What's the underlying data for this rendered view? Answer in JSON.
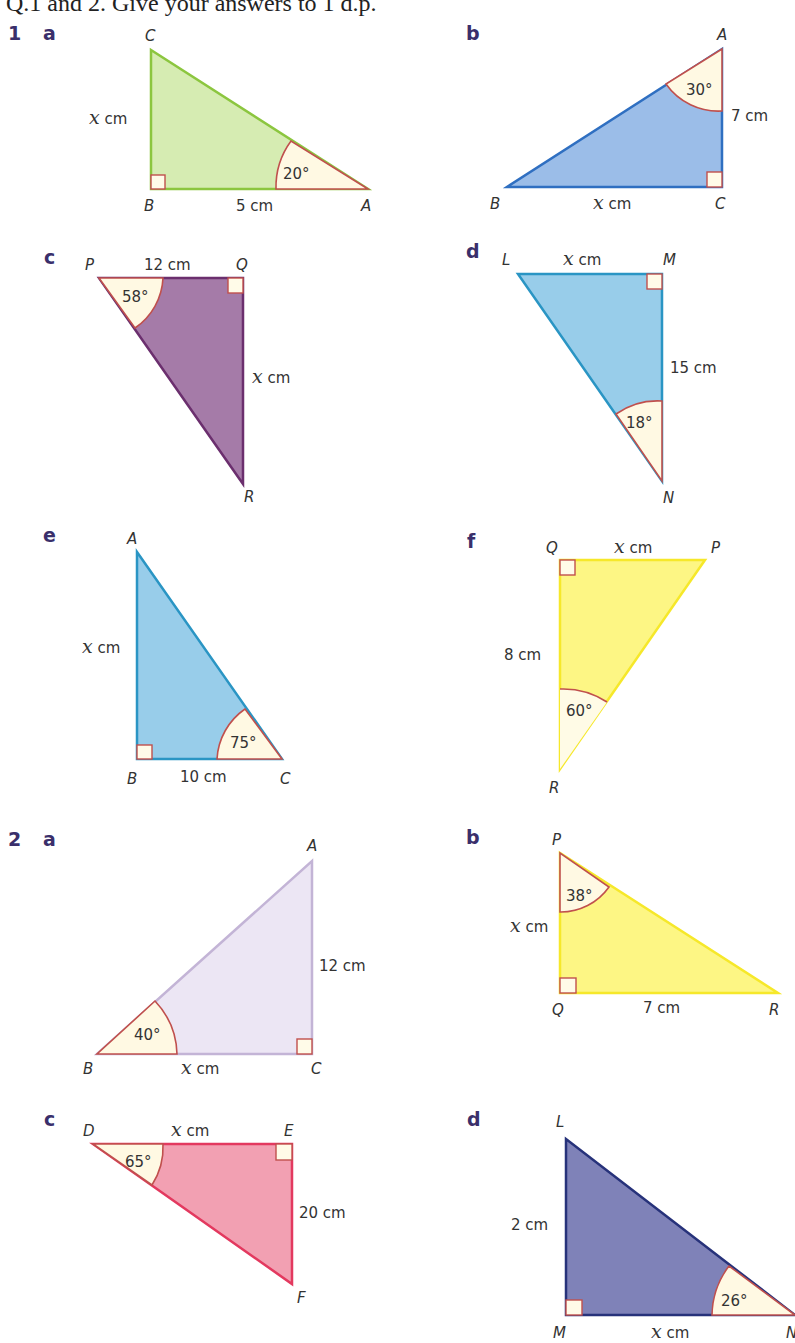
{
  "intro_text": "Q.1 and 2. Give your answers to 1 d.p.",
  "questions": [
    {
      "number": "1",
      "parts": [
        {
          "letter": "a",
          "vertices": {
            "right": "B",
            "top": "C",
            "other": "A"
          },
          "angle": "20°",
          "given": "5 cm",
          "unknown": "x",
          "unknown_unit": " cm",
          "fill": "#d6ecb2",
          "stroke": "#8cc63f"
        },
        {
          "letter": "b",
          "vertices": {
            "top": "A",
            "left": "B",
            "right": "C"
          },
          "angle": "30°",
          "given": "7 cm",
          "unknown": "x",
          "unknown_unit": " cm",
          "fill": "#9bbde8",
          "stroke": "#2f6fc1"
        },
        {
          "letter": "c",
          "vertices": {
            "left": "P",
            "right": "Q",
            "bottom": "R"
          },
          "angle": "58°",
          "given": "12 cm",
          "unknown": "x",
          "unknown_unit": " cm",
          "fill": "#a57ba8",
          "stroke": "#6b2f6e"
        },
        {
          "letter": "d",
          "vertices": {
            "left": "L",
            "right": "M",
            "bottom": "N"
          },
          "angle": "18°",
          "given": "15 cm",
          "unknown": "x",
          "unknown_unit": " cm",
          "fill": "#98cdea",
          "stroke": "#2a95c4"
        },
        {
          "letter": "e",
          "vertices": {
            "top": "A",
            "left": "B",
            "right": "C"
          },
          "angle": "75°",
          "given": "10 cm",
          "unknown": "x",
          "unknown_unit": " cm",
          "fill": "#98cdea",
          "stroke": "#2a95c4"
        },
        {
          "letter": "f",
          "vertices": {
            "left": "Q",
            "right": "P",
            "bottom": "R"
          },
          "angle": "60°",
          "given": "8 cm",
          "unknown": "x",
          "unknown_unit": " cm",
          "fill": "#fdf684",
          "stroke": "#f6e82a"
        }
      ]
    },
    {
      "number": "2",
      "parts": [
        {
          "letter": "a",
          "vertices": {
            "top": "A",
            "left": "B",
            "right": "C"
          },
          "angle": "40°",
          "given": "12 cm",
          "unknown": "x",
          "unknown_unit": " cm",
          "fill": "#ece6f4",
          "stroke": "#c3b4d6"
        },
        {
          "letter": "b",
          "vertices": {
            "top": "P",
            "left": "Q",
            "right": "R"
          },
          "angle": "38°",
          "given": "7 cm",
          "unknown": "x",
          "unknown_unit": " cm",
          "fill": "#fdf684",
          "stroke": "#f6e82a"
        },
        {
          "letter": "c",
          "vertices": {
            "left": "D",
            "right": "E",
            "bottom": "F"
          },
          "angle": "65°",
          "given": "20 cm",
          "unknown": "x",
          "unknown_unit": " cm",
          "fill": "#f2a0b2",
          "stroke": "#e3395f"
        },
        {
          "letter": "d",
          "vertices": {
            "top": "L",
            "left": "M",
            "right": "N"
          },
          "angle": "26°",
          "given": "2 cm",
          "unknown": "x",
          "unknown_unit": " cm",
          "fill": "#7f82b8",
          "stroke": "#27327a"
        }
      ]
    }
  ]
}
